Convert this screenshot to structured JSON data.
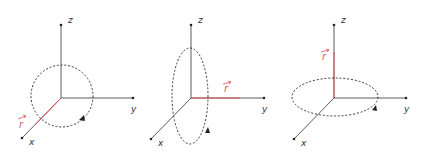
{
  "colors": {
    "axis": "#4a4a4a",
    "vector": "#e0555a",
    "orbit": "#3a3a3a",
    "background": "#ffffff"
  },
  "panels": [
    {
      "id": "rotation-about-x",
      "axes": {
        "x": "x",
        "y": "y",
        "z": "z"
      },
      "vector_label": "r",
      "vector_axis": "x",
      "orbit": "circle in y-z plane, counter-clockwise arrow"
    },
    {
      "id": "rotation-about-y",
      "axes": {
        "x": "x",
        "y": "y",
        "z": "z"
      },
      "vector_label": "r",
      "vector_axis": "y",
      "orbit": "ellipse in x-z plane, arrow at bottom"
    },
    {
      "id": "rotation-about-z",
      "axes": {
        "x": "x",
        "y": "y",
        "z": "z"
      },
      "vector_label": "r",
      "vector_axis": "z",
      "orbit": "ellipse in x-y plane, arrow at right front"
    }
  ]
}
